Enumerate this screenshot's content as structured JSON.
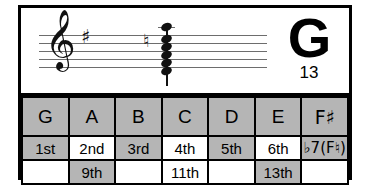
{
  "card": {
    "title": "G13 chord reference"
  },
  "notation": {
    "clef_glyph": "𝄞",
    "clef_name": "treble-clef",
    "key_signature": {
      "glyph": "♯",
      "count": 1,
      "key": "G major"
    },
    "chord": {
      "accidental_glyph": "♮",
      "accidental_name": "natural",
      "note_count": 6,
      "notes": [
        "G",
        "B",
        "D",
        "F",
        "A",
        "E"
      ]
    }
  },
  "symbol": {
    "root": "G",
    "extension": "13"
  },
  "table": {
    "columns": [
      "G",
      "A",
      "B",
      "C",
      "D",
      "E",
      "F♯"
    ],
    "rows": [
      {
        "name": "notes",
        "cells": [
          {
            "text": "G",
            "shade": "gray"
          },
          {
            "text": "A",
            "shade": "gray"
          },
          {
            "text": "B",
            "shade": "gray"
          },
          {
            "text": "C",
            "shade": "gray"
          },
          {
            "text": "D",
            "shade": "gray"
          },
          {
            "text": "E",
            "shade": "gray"
          },
          {
            "text": "F♯",
            "shade": "gray"
          }
        ]
      },
      {
        "name": "degrees",
        "cells": [
          {
            "text": "1st",
            "shade": "gray"
          },
          {
            "text": "2nd",
            "shade": "white"
          },
          {
            "text": "3rd",
            "shade": "gray"
          },
          {
            "text": "4th",
            "shade": "white"
          },
          {
            "text": "5th",
            "shade": "gray"
          },
          {
            "text": "6th",
            "shade": "white"
          },
          {
            "text": "♭7(F♮)",
            "shade": "gray"
          }
        ]
      },
      {
        "name": "extensions",
        "cells": [
          {
            "text": "",
            "shade": "white"
          },
          {
            "text": "9th",
            "shade": "gray"
          },
          {
            "text": "",
            "shade": "white"
          },
          {
            "text": "11th",
            "shade": "white"
          },
          {
            "text": "",
            "shade": "white"
          },
          {
            "text": "13th",
            "shade": "gray"
          },
          {
            "text": "",
            "shade": "white"
          }
        ]
      }
    ]
  },
  "colors": {
    "border": "#000000",
    "cell_gray": "#b5b5b5",
    "cell_white": "#ffffff",
    "staff_line": "#6d6d6d",
    "ink": "#111111"
  }
}
